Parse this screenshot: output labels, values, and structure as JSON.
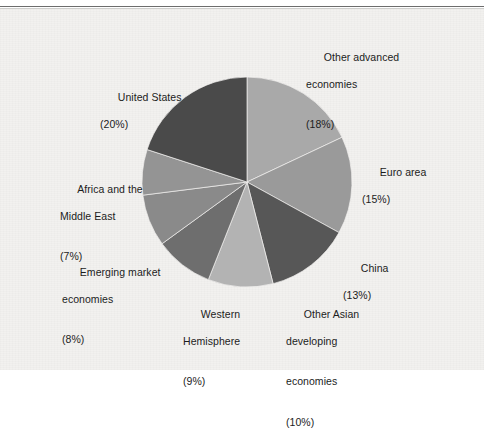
{
  "figure": {
    "background_color": "#f2f1ef",
    "rule_color": "#6d6d6d"
  },
  "chart_data": {
    "type": "pie",
    "title": "",
    "subtitle": "",
    "xlabel": "",
    "ylabel": "",
    "legend_position": "none",
    "grid": false,
    "units": "percent",
    "start_angle_deg": 0,
    "direction": "clockwise",
    "categories": [
      "Other advanced economies",
      "Euro area",
      "China",
      "Other Asian developing economies",
      "Western Hemisphere",
      "Emerging market economies",
      "Africa and the Middle East",
      "United States"
    ],
    "values": [
      18,
      15,
      13,
      10,
      9,
      8,
      7,
      20
    ],
    "colors": [
      "#a9a9a9",
      "#9a9a9a",
      "#575757",
      "#b3b3b3",
      "#6e6e6e",
      "#8a8a8a",
      "#949494",
      "#4a4a4a"
    ],
    "slices": [
      {
        "name": "Other advanced economies",
        "value": 18,
        "label_line1": "Other advanced",
        "label_line2": "economies",
        "label_pct": "(18%)",
        "color": "#a9a9a9"
      },
      {
        "name": "Euro area",
        "value": 15,
        "label_line1": "Euro area",
        "label_line2": "",
        "label_pct": "(15%)",
        "color": "#9a9a9a"
      },
      {
        "name": "China",
        "value": 13,
        "label_line1": "China",
        "label_line2": "",
        "label_pct": "(13%)",
        "color": "#575757"
      },
      {
        "name": "Other Asian developing economies",
        "value": 10,
        "label_line1": "Other Asian",
        "label_line2": "developing",
        "label_line3": "economies",
        "label_pct": "(10%)",
        "color": "#b3b3b3"
      },
      {
        "name": "Western Hemisphere",
        "value": 9,
        "label_line1": "Western",
        "label_line2": "Hemisphere",
        "label_pct": "(9%)",
        "color": "#6e6e6e"
      },
      {
        "name": "Emerging market economies",
        "value": 8,
        "label_line1": "Emerging market",
        "label_line2": "economies",
        "label_pct": "(8%)",
        "color": "#8a8a8a"
      },
      {
        "name": "Africa and the Middle East",
        "value": 7,
        "label_line1": "Africa and the",
        "label_line2": "Middle East",
        "label_pct": "(7%)",
        "color": "#949494"
      },
      {
        "name": "United States",
        "value": 20,
        "label_line1": "United States",
        "label_line2": "",
        "label_pct": "(20%)",
        "color": "#4a4a4a"
      }
    ]
  },
  "labels": {
    "other_advanced": {
      "line1": "Other advanced",
      "line2": "economies",
      "pct": "(18%)"
    },
    "euro_area": {
      "line1": "Euro area",
      "pct": "(15%)"
    },
    "china": {
      "line1": "China",
      "pct": "(13%)"
    },
    "other_asian": {
      "line1": "Other Asian",
      "line2": "developing",
      "line3": "economies",
      "pct": "(10%)"
    },
    "western_hemisphere": {
      "line1": "Western",
      "line2": "Hemisphere",
      "pct": "(9%)"
    },
    "emerging_market": {
      "line1": "Emerging market",
      "line2": "economies",
      "pct": "(8%)"
    },
    "africa_middle_east": {
      "line1": "Africa and the",
      "line2": "Middle East",
      "pct": "(7%)"
    },
    "united_states": {
      "line1": "United States",
      "pct": "(20%)"
    }
  }
}
